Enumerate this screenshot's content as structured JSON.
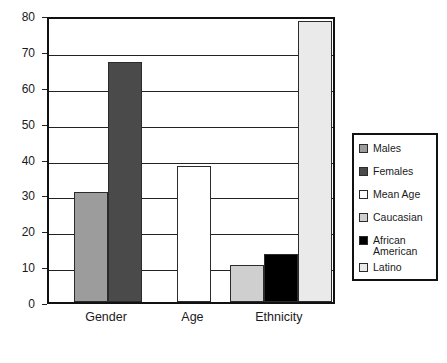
{
  "chart_data": {
    "type": "bar",
    "title": "",
    "subtitle": "",
    "xlabel": "",
    "ylabel": "",
    "categories": [
      "Gender",
      "Age",
      "Ethnicity"
    ],
    "ylim": [
      0,
      80
    ],
    "yticks": [
      0,
      10,
      20,
      30,
      40,
      50,
      60,
      70,
      80
    ],
    "ytick_labels": [
      "0",
      "10",
      "20",
      "30",
      "40",
      "50",
      "60",
      "70",
      "80"
    ],
    "grid": true,
    "legend_position": "right",
    "series": [
      {
        "name": "Males",
        "category": "Gender",
        "value": 30.6,
        "color": "#9c9c9c"
      },
      {
        "name": "Females",
        "category": "Gender",
        "value": 67.0,
        "color": "#4a4a4a"
      },
      {
        "name": "Mean Age",
        "category": "Age",
        "value": 38.0,
        "color": "#ffffff"
      },
      {
        "name": "Caucasian",
        "category": "Ethnicity",
        "value": 10.2,
        "color": "#cfcfcf"
      },
      {
        "name": "African American",
        "category": "Ethnicity",
        "value": 13.5,
        "color": "#000000"
      },
      {
        "name": "Latino",
        "category": "Ethnicity",
        "value": 78.3,
        "color": "#eaeaea"
      }
    ],
    "legend": [
      {
        "label": "Males",
        "color": "#9c9c9c"
      },
      {
        "label": "Females",
        "color": "#4a4a4a"
      },
      {
        "label": "Mean Age",
        "color": "#ffffff"
      },
      {
        "label": "Caucasian",
        "color": "#cfcfcf"
      },
      {
        "label": "African American",
        "color": "#000000"
      },
      {
        "label": "Latino",
        "color": "#eaeaea"
      }
    ],
    "axis_color": "#111111",
    "grid_color": "#222222",
    "background": "#ffffff"
  }
}
